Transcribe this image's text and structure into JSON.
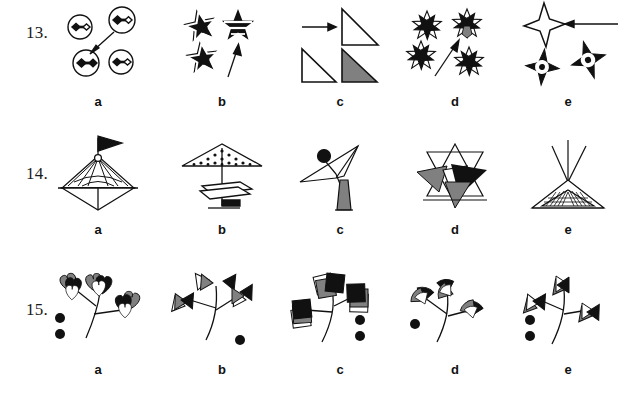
{
  "document": {
    "type": "visual-analogy-worksheet",
    "background_color": "#ffffff",
    "ink_color": "#000000",
    "fill_gray": "#808080",
    "fill_black": "#1a1a1a",
    "fill_white": "#ffffff"
  },
  "option_labels": [
    "a",
    "b",
    "c",
    "d",
    "e"
  ],
  "questions": [
    {
      "number": "13.",
      "options": [
        {
          "label": "a",
          "description": "four small circles each containing a barbell of a filled diamond and an open diamond; an arrow points from the upper-right circle down-left to the lower-left circle which has two filled diamonds"
        },
        {
          "label": "b",
          "description": "three five-pointed stars with white inner outlines; an arrow points up to the upper-right star which has horizontal bands"
        },
        {
          "label": "c",
          "description": "two rows: arrow pointing right to an outlined right triangle on top; an outlined right triangle and a gray-filled right triangle below"
        },
        {
          "label": "d",
          "description": "four pinwheel star rosettes of black and white petals; an arrow points diagonally up-right to the upper-right rosette which contains a gray petal"
        },
        {
          "label": "e",
          "description": "an outlined four-pointed star with a horizontal arrow pointing left into it; two filled four-pointed stars with white dotted circles below"
        }
      ]
    },
    {
      "number": "14.",
      "options": [
        {
          "label": "a",
          "description": "sailboat-like figure: black triangular pennant on a mast above a fan-ribbed triangle over a diamond hull"
        },
        {
          "label": "b",
          "description": "parasol with dotted canopy above a flat parallelogram plate and a small black flag at the bottom of the pole"
        },
        {
          "label": "c",
          "description": "thin angular bird/antenna shape with a small black ball and a gray filled triangular base"
        },
        {
          "label": "d",
          "description": "outlined six-pointed star overlaid with gray and black triangles"
        },
        {
          "label": "e",
          "description": "teepee: crossed poles above a triangle with a hatched band inside"
        }
      ]
    },
    {
      "number": "15.",
      "options": [
        {
          "label": "a",
          "description": "curved plant stem with three clover/heart shaped leaves in black, gray and white; two filled dots at left",
          "dots": 2
        },
        {
          "label": "b",
          "description": "curved plant stem with three bowtie/arrow shaped leaves in black, gray and white; one filled dot at right",
          "dots": 1
        },
        {
          "label": "c",
          "description": "curved plant stem with three square shaped leaves in black, gray and white; two filled dots at right",
          "dots": 2
        },
        {
          "label": "d",
          "description": "curved plant stem with three fan/shell shaped leaves in black, gray and white; one filled dot at left",
          "dots": 1
        },
        {
          "label": "e",
          "description": "curved plant stem with three bowtie/arrow shaped leaves in black, gray and white; two filled dots at left",
          "dots": 2
        }
      ]
    }
  ]
}
